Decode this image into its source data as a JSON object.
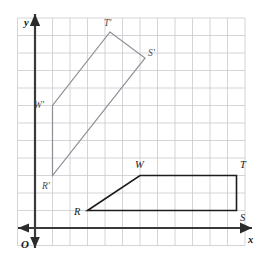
{
  "figure": {
    "background_color": "#ffffff",
    "grid": {
      "line_color": "#c9c9cf",
      "spacing_px": 17.5,
      "origin_px": {
        "x": 35,
        "y": 228
      },
      "columns": 12,
      "rows": 12,
      "visible": true
    },
    "axes": {
      "color": "#3a3a3a",
      "x_axis": {
        "label": "x",
        "label_px": {
          "x": 248,
          "y": 243
        },
        "y_px": 228,
        "x_start_px": 18,
        "x_end_px": 252,
        "arrow_right": true,
        "arrow_left": true
      },
      "y_axis": {
        "label": "y",
        "label_px": {
          "x": 24,
          "y": 26
        },
        "x_px": 35,
        "y_start_px": 14,
        "y_end_px": 248,
        "arrow_up": true,
        "arrow_down": true
      },
      "origin": {
        "label": "O",
        "label_px": {
          "x": 21,
          "y": 248
        }
      }
    },
    "shapes": [
      {
        "name": "quadrilateral-RSTW",
        "role": "preimage",
        "stroke_color": "#1d1d1d",
        "stroke_width": 1.6,
        "closed": true,
        "vertices": [
          {
            "label": "R",
            "grid": {
              "x": 3,
              "y": 1
            },
            "px": {
              "x": 87.5,
              "y": 210.5
            },
            "label_px": {
              "x": 74,
              "y": 215
            }
          },
          {
            "label": "W",
            "grid": {
              "x": 6,
              "y": 3
            },
            "px": {
              "x": 140,
              "y": 175.5
            },
            "label_px": {
              "x": 135,
              "y": 168
            }
          },
          {
            "label": "T",
            "grid": {
              "x": 11.5,
              "y": 3
            },
            "px": {
              "x": 236.5,
              "y": 175.5
            },
            "label_px": {
              "x": 240,
              "y": 168
            }
          },
          {
            "label": "S",
            "grid": {
              "x": 11.5,
              "y": 1
            },
            "px": {
              "x": 236.5,
              "y": 210.5
            },
            "label_px": {
              "x": 240,
              "y": 221
            }
          }
        ]
      },
      {
        "name": "quadrilateral-R-prime-S-prime-T-prime-W-prime",
        "role": "image",
        "stroke_color": "#8d8d93",
        "stroke_width": 1.2,
        "closed": true,
        "vertices": [
          {
            "label": "R'",
            "grid": {
              "x": 1,
              "y": 3
            },
            "px": {
              "x": 52.5,
              "y": 175.5
            },
            "label_px": {
              "x": 42,
              "y": 189
            }
          },
          {
            "label": "W'",
            "grid": {
              "x": 1,
              "y": 7
            },
            "px": {
              "x": 52.5,
              "y": 105.5
            },
            "label_px": {
              "x": 34,
              "y": 108
            }
          },
          {
            "label": "T'",
            "grid": {
              "x": 4.3,
              "y": 11.2
            },
            "px": {
              "x": 110,
              "y": 32
            },
            "label_px": {
              "x": 104,
              "y": 26
            }
          },
          {
            "label": "S'",
            "grid": {
              "x": 6.3,
              "y": 9.7
            },
            "px": {
              "x": 145,
              "y": 58
            },
            "label_px": {
              "x": 148,
              "y": 56
            }
          }
        ]
      }
    ]
  }
}
